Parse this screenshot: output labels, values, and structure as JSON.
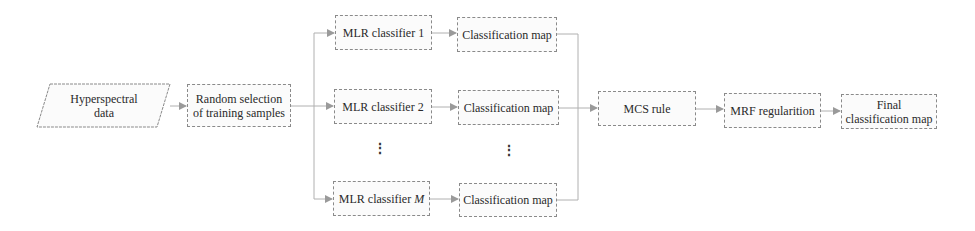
{
  "diagram": {
    "type": "flowchart",
    "nodes": {
      "input": {
        "label_line1": "Hyperspectral",
        "label_line2": "data",
        "shape": "parallelogram"
      },
      "sampling": {
        "label_line1": "Random selection",
        "label_line2": "of training samples"
      },
      "classifiers": [
        {
          "label": "MLR classifier 1",
          "map_label": "Classification map"
        },
        {
          "label": "MLR classifier 2",
          "map_label": "Classification map"
        },
        {
          "label_prefix": "MLR classifier ",
          "label_var": "M",
          "map_label": "Classification map"
        }
      ],
      "ellipsis": "⋮",
      "mcs": {
        "label": "MCS rule"
      },
      "mrf": {
        "label": "MRF regularition"
      },
      "output": {
        "label_line1": "Final",
        "label_line2": "classification map"
      }
    },
    "colors": {
      "stroke": "#8a8a8a",
      "arrow": "#9a9a9a",
      "text": "#2a2a2a"
    }
  }
}
